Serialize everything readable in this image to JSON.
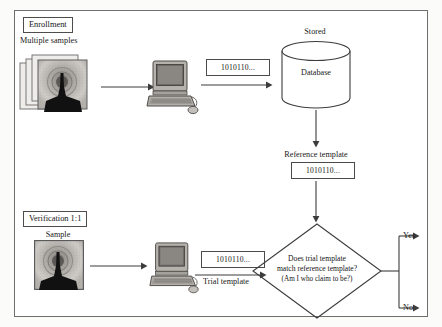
{
  "diagram": {
    "frame_color": "#6f6f6f"
  },
  "enrollment": {
    "tag_label": "Enrollment",
    "samples_label": "Multiple samples",
    "samples_icon": "fingerprint-stack-icon",
    "computer_icon": "desktop-computer-icon",
    "template_bits": "1010110...",
    "stored_label": "Stored",
    "database_label": "Database",
    "database_icon": "database-cylinder-icon",
    "reference_template_label": "Reference template",
    "reference_template_bits": "1010110..."
  },
  "verification": {
    "tag_label": "Verification 1:1",
    "sample_label": "Sample",
    "sample_icon": "fingerprint-icon",
    "computer_icon": "desktop-computer-icon",
    "trial_template_bits": "1010110...",
    "trial_template_label": "Trial template"
  },
  "decision": {
    "question_line1": "Does trial template",
    "question_line2": "match reference template?",
    "question_line3": "(Am I who claim to be?)",
    "outcome_yes": "Yes",
    "outcome_no": "No"
  }
}
